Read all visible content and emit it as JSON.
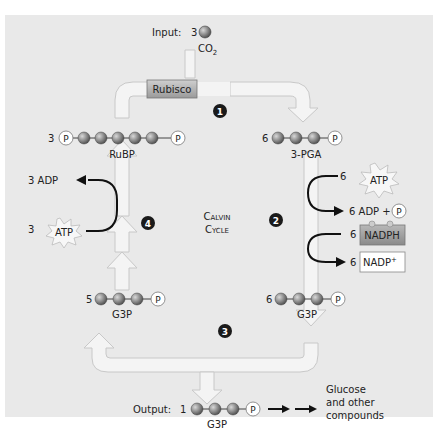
{
  "title": "Calvin Cycle",
  "colors": {
    "panel_bg": "#e9e9e9",
    "track": "#f4f4f4",
    "track_border": "#c8c8c8",
    "carbon": "#8a8a8a",
    "rubisco_bg": "#b5b5b5",
    "nadph_bg": "#9e9e9e",
    "step_badge": "#1a1a1a"
  },
  "input": {
    "label": "Input:",
    "count": "3",
    "molecule": "CO",
    "subscript": "2"
  },
  "rubisco": {
    "label": "Rubisco"
  },
  "center": {
    "line1": "Calvin",
    "line2": "Cycle"
  },
  "steps": [
    "1",
    "2",
    "3",
    "4"
  ],
  "molecules": {
    "rubp": {
      "count": "3",
      "name": "RuBP",
      "phosphate": "P"
    },
    "pga": {
      "count": "6",
      "name": "3-PGA",
      "phosphate": "P"
    },
    "g3p_right": {
      "count": "6",
      "name": "G3P",
      "phosphate": "P"
    },
    "g3p_left": {
      "count": "5",
      "name": "G3P",
      "phosphate": "P"
    },
    "g3p_output": {
      "count": "1",
      "name": "G3P",
      "phosphate": "P"
    }
  },
  "step2": {
    "atp_count": "6",
    "atp_label": "ATP",
    "adp_label": "6 ADP +",
    "phosphate": "P",
    "nadph_count": "6",
    "nadph_label": "NADPH",
    "nadp_count": "6",
    "nadp_label": "NADP",
    "nadp_sup": "+"
  },
  "step4": {
    "adp_label": "3 ADP",
    "atp_count": "3",
    "atp_label": "ATP"
  },
  "output": {
    "label": "Output:",
    "product_line1": "Glucose",
    "product_line2": "and other",
    "product_line3": "compounds"
  }
}
